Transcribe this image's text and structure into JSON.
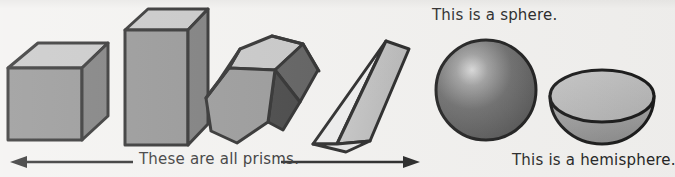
{
  "page": {
    "background_color": "#f2f1ef",
    "width": 675,
    "height": 177,
    "ink_color": "#1a1a1a"
  },
  "palette": {
    "face_top_light": "#c2c2c2",
    "face_front_mid": "#8a8a8a",
    "face_side_dark": "#6e6e6e",
    "face_very_dark": "#3a3a3a",
    "face_near_white": "#ececec",
    "face_pale": "#b8b8b8",
    "sphere_base": "#5f5f5f",
    "sphere_highlight": "#d8d8d8",
    "hemi_rim_light": "#bdbdbd",
    "hemi_bowl_mid": "#9d9d9d"
  },
  "labels": {
    "sphere": "This is a sphere.",
    "hemisphere": "This is a hemisphere.",
    "prisms": "These are all prisms."
  },
  "annotations": {
    "prisms_arrow": {
      "name": "double-headed-arrow",
      "direction": "both",
      "left_x": 14,
      "right_x": 420,
      "y": 162
    }
  },
  "shapes": [
    {
      "id": "cube",
      "name": "cube",
      "kind": "prism",
      "caption_group": "prisms",
      "description": "Cube drawn in oblique projection with light top face, mid-grey front face and darker right face."
    },
    {
      "id": "cuboid",
      "name": "rectangular-prism",
      "kind": "prism",
      "caption_group": "prisms",
      "description": "Tall rectangular prism (cuboid) standing upright."
    },
    {
      "id": "hexagonal-prism",
      "name": "hexagonal-prism",
      "kind": "prism",
      "caption_group": "prisms",
      "description": "Hexagonal prism tilted, hexagonal face toward the viewer."
    },
    {
      "id": "triangular-prism",
      "name": "triangular-prism",
      "kind": "prism",
      "caption_group": "prisms",
      "description": "Triangular prism with a near-white triangular end face."
    },
    {
      "id": "sphere",
      "name": "sphere",
      "kind": "curved-solid",
      "caption_group": "sphere",
      "description": "Shaded sphere with a highlight in the upper left."
    },
    {
      "id": "hemisphere",
      "name": "hemisphere",
      "kind": "curved-solid",
      "caption_group": "hemisphere",
      "description": "Hemisphere shown as a bowl with a visible elliptical flat face on top."
    }
  ]
}
